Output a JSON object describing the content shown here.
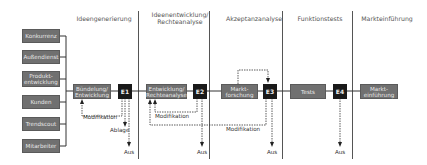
{
  "phases": [
    {
      "label": "Ideengenerierung"
    },
    {
      "label": "Ideenentwicklung/",
      "label2": "Rechteanalyse"
    },
    {
      "label": "Akzeptanzanalyse"
    },
    {
      "label": "Funktionstests"
    },
    {
      "label": "Markteinführung"
    }
  ],
  "sources": [
    {
      "label": "Konkurrenz"
    },
    {
      "label": "Außendienst"
    },
    {
      "label": "Produkt-",
      "label2": "entwicklung"
    },
    {
      "label": "Kunden"
    },
    {
      "label": "Trendscout"
    },
    {
      "label": "Mitarbeiter"
    }
  ],
  "steps": [
    {
      "label": "Bündelung/",
      "label2": "Entwicklung"
    },
    {
      "label": "Entwicklung/",
      "label2": "Rechteanalyse"
    },
    {
      "label": "Markt-",
      "label2": "forschung"
    },
    {
      "label": "Tests"
    },
    {
      "label": "Markt-",
      "label2": "einführung"
    }
  ],
  "gates": [
    {
      "label": "E1"
    },
    {
      "label": "E2"
    },
    {
      "label": "E3"
    },
    {
      "label": "E4"
    }
  ],
  "feedback": {
    "modifikation": "Modifikation",
    "ablage": "Ablage",
    "aus": "Aus"
  },
  "colors": {
    "box": "#707070",
    "gate": "#1a1a1a",
    "line": "#333333"
  }
}
